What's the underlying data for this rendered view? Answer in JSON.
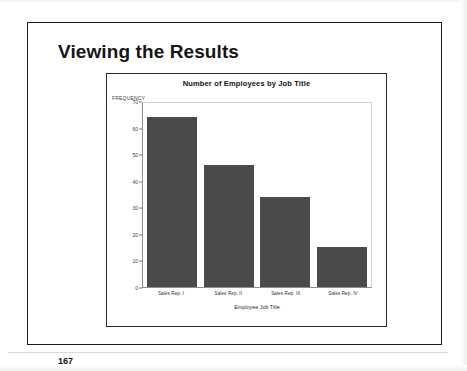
{
  "slide": {
    "title": "Viewing the Results",
    "page_number": "167"
  },
  "chart_data": {
    "type": "bar",
    "title": "Number of Employees by Job Title",
    "xlabel": "Employee Job Title",
    "ylabel": "FREQUENCY",
    "categories": [
      "Sales Rep. I",
      "Sales Rep. II",
      "Sales Rep. III",
      "Sales Rep. IV"
    ],
    "values": [
      64,
      46,
      34,
      15
    ],
    "ylim": [
      0,
      70
    ],
    "yticks": [
      0,
      10,
      20,
      30,
      40,
      50,
      60,
      70
    ],
    "ytick_labels": [
      "0",
      "10",
      "20",
      "30",
      "40",
      "50",
      "60",
      "70"
    ],
    "grid": false,
    "legend": null,
    "bar_color": "#4a4a4a"
  }
}
